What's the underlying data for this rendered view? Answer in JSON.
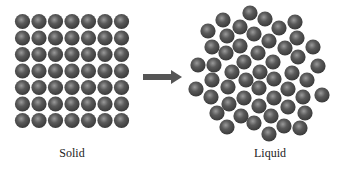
{
  "diagram": {
    "colors": {
      "sphere_dark": "#3e3e3e",
      "sphere_mid": "#5a5a5a",
      "sphere_light": "#9a9a9a",
      "arrow": "#555555",
      "label": "#222222"
    },
    "solid": {
      "label": "Solid",
      "label_pos": [
        72,
        146
      ],
      "grid": {
        "rows": 7,
        "cols": 7,
        "origin": [
          22.5,
          21.5
        ],
        "pitch": 16.5,
        "radius": 7.6
      }
    },
    "arrow": {
      "shaft": {
        "x1": 143,
        "x2": 172,
        "y": 77,
        "thickness": 6
      },
      "head": {
        "tip": [
          182,
          77
        ],
        "base_x": 171,
        "half_height": 7
      }
    },
    "liquid": {
      "label": "Liquid",
      "label_pos": [
        270,
        146
      ],
      "radius": 7.6,
      "particles": [
        [
          250,
          13
        ],
        [
          265,
          19
        ],
        [
          223,
          20
        ],
        [
          295,
          22
        ],
        [
          240,
          27
        ],
        [
          279,
          28
        ],
        [
          208,
          31
        ],
        [
          254,
          34
        ],
        [
          227,
          36
        ],
        [
          297,
          38
        ],
        [
          269,
          41
        ],
        [
          212,
          47
        ],
        [
          240,
          46
        ],
        [
          285,
          48
        ],
        [
          313,
          47
        ],
        [
          258,
          53
        ],
        [
          226,
          53
        ],
        [
          298,
          57
        ],
        [
          198,
          65
        ],
        [
          214,
          65
        ],
        [
          244,
          62
        ],
        [
          273,
          62
        ],
        [
          318,
          66
        ],
        [
          232,
          72
        ],
        [
          260,
          72
        ],
        [
          292,
          73
        ],
        [
          212,
          80
        ],
        [
          246,
          80
        ],
        [
          274,
          79
        ],
        [
          307,
          80
        ],
        [
          196,
          89
        ],
        [
          228,
          87
        ],
        [
          259,
          88
        ],
        [
          288,
          89
        ],
        [
          322,
          95
        ],
        [
          211,
          97
        ],
        [
          244,
          98
        ],
        [
          274,
          98
        ],
        [
          303,
          97
        ],
        [
          229,
          104
        ],
        [
          259,
          106
        ],
        [
          288,
          107
        ],
        [
          217,
          113
        ],
        [
          241,
          116
        ],
        [
          271,
          116
        ],
        [
          305,
          113
        ],
        [
          227,
          127
        ],
        [
          254,
          123
        ],
        [
          284,
          126
        ],
        [
          300,
          128
        ],
        [
          269,
          134
        ]
      ]
    }
  }
}
